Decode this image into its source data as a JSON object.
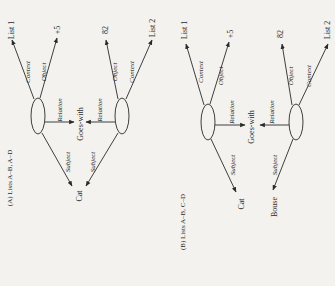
{
  "diagrams": [
    {
      "caption": "(A) Lists A–B, A–D",
      "nodes": {
        "list1": "List 1",
        "plus5": "+5",
        "n82": "82",
        "list2": "List 2",
        "goes_with": "Goes-with",
        "cat": "Cat"
      },
      "edge_labels": {
        "context1": "Context",
        "object1": "Object",
        "relation1": "Relation",
        "subject1": "Subject",
        "object2": "Object",
        "context2": "Context",
        "relation2": "Relation",
        "subject2": "Subject"
      }
    },
    {
      "caption": "(B) Lists A–B, C–D",
      "nodes": {
        "list1": "List 1",
        "plus5": "+5",
        "n82": "82",
        "list2": "List 2",
        "goes_with": "Goes-with",
        "cat": "Cat",
        "bouse": "Bouse"
      },
      "edge_labels": {
        "context1": "Context",
        "object1": "Object",
        "relation1": "Relation",
        "subject1": "Subject",
        "object2": "Object",
        "context2": "Context",
        "relation2": "Relation",
        "subject2": "Subject"
      }
    }
  ]
}
